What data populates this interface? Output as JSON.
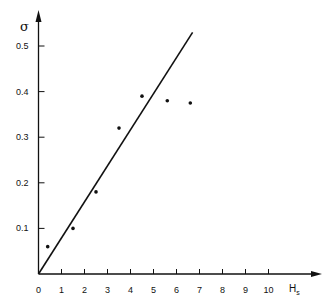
{
  "chart_data": {
    "type": "scatter",
    "title": "",
    "xlabel": "H",
    "xlabel_subscript": "s",
    "ylabel": "σ",
    "xlim": [
      0,
      12
    ],
    "ylim": [
      0,
      0.55
    ],
    "grid": false,
    "x_ticks": [
      "0",
      "1",
      "2",
      "3",
      "4",
      "5",
      "6",
      "7",
      "8",
      "9",
      "10"
    ],
    "y_ticks": [
      "0.1",
      "0.2",
      "0.3",
      "0.4",
      "0.5"
    ],
    "series": [
      {
        "name": "data points",
        "type": "scatter",
        "x": [
          0.4,
          1.5,
          2.5,
          3.5,
          4.5,
          5.6,
          6.6
        ],
        "y": [
          0.06,
          0.1,
          0.18,
          0.32,
          0.39,
          0.38,
          0.375
        ]
      },
      {
        "name": "fit line",
        "type": "line",
        "x": [
          0,
          6.7
        ],
        "y": [
          0,
          0.53
        ]
      }
    ]
  },
  "colors": {
    "ink": "#111111",
    "background": "#ffffff"
  }
}
